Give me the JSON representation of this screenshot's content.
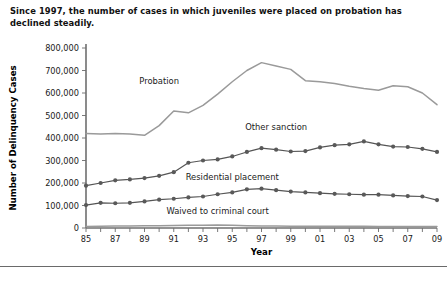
{
  "caption": "Since 1997, the number of cases in which juveniles were placed on probation has declined steadily.",
  "chart_data": {
    "type": "line",
    "title": "",
    "xlabel": "Year",
    "ylabel": "Number of Delinquency Cases",
    "xlim": [
      1985,
      2009
    ],
    "ylim": [
      0,
      800000
    ],
    "grid": false,
    "legend_position": "inline-annotations",
    "x": [
      1985,
      1986,
      1987,
      1988,
      1989,
      1990,
      1991,
      1992,
      1993,
      1994,
      1995,
      1996,
      1997,
      1998,
      1999,
      2000,
      2001,
      2002,
      2003,
      2004,
      2005,
      2006,
      2007,
      2008,
      2009
    ],
    "x_tick_labels": [
      "85",
      "",
      "87",
      "",
      "89",
      "",
      "91",
      "",
      "93",
      "",
      "95",
      "",
      "97",
      "",
      "99",
      "",
      "01",
      "",
      "03",
      "",
      "05",
      "",
      "07",
      "",
      "09"
    ],
    "y_tick_labels": [
      "0",
      "100,000",
      "200,000",
      "300,000",
      "400,000",
      "500,000",
      "600,000",
      "700,000",
      "800,000"
    ],
    "y_ticks": [
      0,
      100000,
      200000,
      300000,
      400000,
      500000,
      600000,
      700000,
      800000
    ],
    "series": [
      {
        "name": "Probation",
        "style": "plain-line",
        "color": "#9a9a9a",
        "label_x": 1990,
        "label_y": 640000,
        "values": [
          420000,
          418000,
          420000,
          418000,
          412000,
          455000,
          520000,
          512000,
          545000,
          595000,
          650000,
          700000,
          735000,
          720000,
          705000,
          655000,
          650000,
          642000,
          630000,
          620000,
          612000,
          632000,
          628000,
          600000,
          548000
        ]
      },
      {
        "name": "Other sanction",
        "style": "marked-line",
        "color": "#595959",
        "label_x": 1998,
        "label_y": 435000,
        "values": [
          188000,
          200000,
          212000,
          216000,
          222000,
          232000,
          248000,
          290000,
          300000,
          305000,
          318000,
          338000,
          355000,
          348000,
          340000,
          342000,
          358000,
          368000,
          372000,
          385000,
          372000,
          362000,
          360000,
          352000,
          338000
        ]
      },
      {
        "name": "Residential placement",
        "style": "marked-line",
        "color": "#595959",
        "label_x": 1995,
        "label_y": 215000,
        "values": [
          102000,
          112000,
          110000,
          112000,
          118000,
          126000,
          130000,
          136000,
          140000,
          150000,
          158000,
          172000,
          175000,
          168000,
          162000,
          158000,
          155000,
          152000,
          150000,
          148000,
          148000,
          145000,
          142000,
          140000,
          124000
        ]
      },
      {
        "name": "Waived to criminal court",
        "style": "label-only",
        "color": "#595959",
        "label_x": 1994,
        "label_y": 62000,
        "values": [
          7200,
          8000,
          8600,
          9000,
          9600,
          10500,
          11500,
          11800,
          12000,
          13000,
          12000,
          10500,
          9300,
          8500,
          8100,
          7700,
          7600,
          7500,
          7400,
          7300,
          7200,
          7100,
          7000,
          6900,
          6800
        ]
      }
    ]
  }
}
